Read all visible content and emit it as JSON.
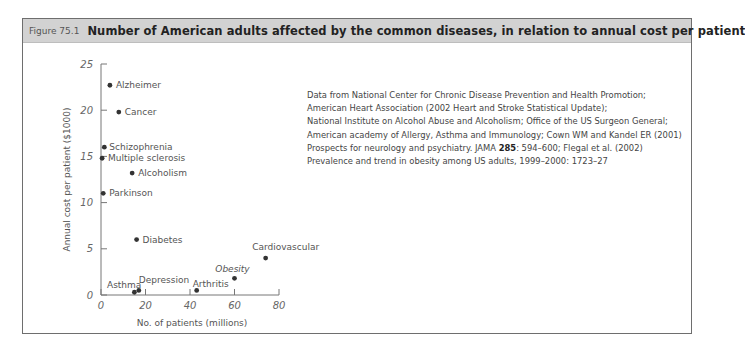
{
  "figure": {
    "number": "Figure 75.1",
    "title": "Number of American adults affected by the common diseases, in relation to annual cost per patient"
  },
  "chart_data": {
    "type": "scatter",
    "title": "Number of American adults affected by the common diseases, in relation to annual cost per patient",
    "xlabel": "No. of patients (millions)",
    "ylabel": "Annual cost per patient ($1000)",
    "xlim": [
      0,
      80
    ],
    "ylim": [
      0,
      25
    ],
    "xticks": [
      "0",
      "20",
      "40",
      "60",
      "80"
    ],
    "yticks": [
      "0",
      "5",
      "10",
      "15",
      "20",
      "25"
    ],
    "grid": false,
    "legend": "none (points labeled directly)",
    "points": [
      {
        "label": "Alzheimer",
        "x": 4,
        "y": 22.7
      },
      {
        "label": "Cancer",
        "x": 8,
        "y": 19.8
      },
      {
        "label": "Schizophrenia",
        "x": 1.5,
        "y": 16
      },
      {
        "label": "Multiple sclerosis",
        "x": 0.5,
        "y": 14.8
      },
      {
        "label": "Alcoholism",
        "x": 14,
        "y": 13.2
      },
      {
        "label": "Parkinson",
        "x": 1,
        "y": 11
      },
      {
        "label": "Diabetes",
        "x": 16,
        "y": 6
      },
      {
        "label": "Cardiovascular",
        "x": 74,
        "y": 4
      },
      {
        "label": "Obesity",
        "x": 60,
        "y": 1.8
      },
      {
        "label": "Arthritis",
        "x": 43,
        "y": 0.5
      },
      {
        "label": "Depression",
        "x": 17,
        "y": 0.5
      },
      {
        "label": "Asthma",
        "x": 15,
        "y": 0.3
      }
    ]
  },
  "source": {
    "line1": "Data from National Center for Chronic Disease Prevention and Health Promotion;",
    "line2": "American Heart Association (2002 Heart and Stroke Statistical Update);",
    "line3": "National Institute on Alcohol Abuse and Alcoholism; Office of the US Surgeon General;",
    "line4": "American academy of Allergy, Asthma and Immunology; Cown WM and Kandel ER (2001)",
    "line5_a": "Prospects for neurology and psychiatry. JAMA ",
    "line5_b": "285",
    "line5_c": ": 594–600; Flegal et al. (2002)",
    "line6": "Prevalence and trend in obesity among US adults, 1999–2000: 1723–27"
  }
}
